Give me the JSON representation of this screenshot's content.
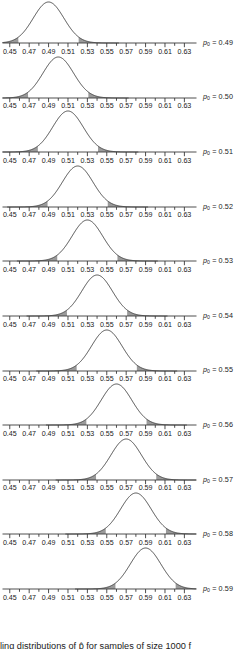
{
  "figure": {
    "caption": "ling distributions of p̂ for samples of size 1000 f",
    "panel_label_prefix": "p",
    "panel_label_subscript": "0",
    "panel_label_separator": " = "
  },
  "axis": {
    "tick_labels": [
      "0.45",
      "0.47",
      "0.49",
      "0.51",
      "0.53",
      "0.55",
      "0.57",
      "0.59",
      "0.61",
      "0.63"
    ],
    "tick_values": [
      0.45,
      0.47,
      0.49,
      0.51,
      0.53,
      0.55,
      0.57,
      0.59,
      0.61,
      0.63
    ],
    "minor_tick_values": [
      0.46,
      0.48,
      0.5,
      0.52,
      0.54,
      0.56,
      0.58,
      0.6,
      0.62
    ],
    "axis_min": 0.4425,
    "axis_max": 0.6425,
    "label_min": 0.45,
    "label_max": 0.63
  },
  "colors": {
    "curve": "#3a3a3a",
    "axis": "#3a3a3a",
    "tail_fill": "#9a9a9a",
    "text": "#1a1a1a",
    "background": "#ffffff"
  },
  "chart_data": {
    "type": "line",
    "title": "",
    "xlabel": "",
    "ylabel": "",
    "xlim": [
      0.4425,
      0.6425
    ],
    "grid": false,
    "legend": "right",
    "sample_size": 1000,
    "sigma": 0.0158,
    "tail_area_each_side": 0.025,
    "panels": [
      {
        "label": "p₀ = 0.49",
        "p0": 0.49,
        "mean": 0.49,
        "sd": 0.0158,
        "lower_cut": 0.459,
        "upper_cut": 0.521,
        "tick_labels": [
          "0.45",
          "0.47",
          "0.49",
          "0.51",
          "0.53",
          "0.55",
          "0.57",
          "0.59",
          "0.61",
          "0.63"
        ]
      },
      {
        "label": "p₀ = 0.50",
        "p0": 0.5,
        "mean": 0.5,
        "sd": 0.0158,
        "lower_cut": 0.469,
        "upper_cut": 0.531,
        "tick_labels": [
          "0.45",
          "0.47",
          "0.49",
          "0.51",
          "0.53",
          "0.55",
          "0.57",
          "0.59",
          "0.61",
          "0.63"
        ]
      },
      {
        "label": "p₀ = 0.51",
        "p0": 0.51,
        "mean": 0.51,
        "sd": 0.0158,
        "lower_cut": 0.479,
        "upper_cut": 0.541,
        "tick_labels": [
          "0.45",
          "0.47",
          "0.49",
          "0.51",
          "0.53",
          "0.55",
          "0.57",
          "0.59",
          "0.61",
          "0.63"
        ]
      },
      {
        "label": "p₀ = 0.52",
        "p0": 0.52,
        "mean": 0.52,
        "sd": 0.0158,
        "lower_cut": 0.489,
        "upper_cut": 0.551,
        "tick_labels": [
          "0.45",
          "0.47",
          "0.49",
          "0.51",
          "0.53",
          "0.55",
          "0.57",
          "0.59",
          "0.61",
          "0.63"
        ]
      },
      {
        "label": "p₀ = 0.53",
        "p0": 0.53,
        "mean": 0.53,
        "sd": 0.0158,
        "lower_cut": 0.499,
        "upper_cut": 0.561,
        "tick_labels": [
          "0.45",
          "0.47",
          "0.49",
          "0.51",
          "0.53",
          "0.55",
          "0.57",
          "0.59",
          "0.61",
          "0.63"
        ]
      },
      {
        "label": "p₀ = 0.54",
        "p0": 0.54,
        "mean": 0.54,
        "sd": 0.0158,
        "lower_cut": 0.509,
        "upper_cut": 0.571,
        "tick_labels": [
          "0.45",
          "0.47",
          "0.49",
          "0.51",
          "0.53",
          "0.55",
          "0.57",
          "0.59",
          "0.61",
          "0.63"
        ]
      },
      {
        "label": "p₀ = 0.55",
        "p0": 0.55,
        "mean": 0.55,
        "sd": 0.0158,
        "lower_cut": 0.519,
        "upper_cut": 0.581,
        "tick_labels": [
          "0.45",
          "0.47",
          "0.49",
          "0.51",
          "0.53",
          "0.55",
          "0.57",
          "0.59",
          "0.61",
          "0.63"
        ]
      },
      {
        "label": "p₀ = 0.56",
        "p0": 0.56,
        "mean": 0.56,
        "sd": 0.0158,
        "lower_cut": 0.529,
        "upper_cut": 0.591,
        "tick_labels": [
          "0.45",
          "0.47",
          "0.49",
          "0.51",
          "0.53",
          "0.55",
          "0.57",
          "0.59",
          "0.61",
          "0.63"
        ]
      },
      {
        "label": "p₀ = 0.57",
        "p0": 0.57,
        "mean": 0.57,
        "sd": 0.0158,
        "lower_cut": 0.539,
        "upper_cut": 0.601,
        "tick_labels": [
          "0.45",
          "0.47",
          "0.49",
          "0.51",
          "0.53",
          "0.55",
          "0.57",
          "0.59",
          "0.61",
          "0.63"
        ]
      },
      {
        "label": "p₀ = 0.58",
        "p0": 0.58,
        "mean": 0.58,
        "sd": 0.0158,
        "lower_cut": 0.549,
        "upper_cut": 0.611,
        "tick_labels": [
          "0.45",
          "0.47",
          "0.49",
          "0.51",
          "0.53",
          "0.55",
          "0.57",
          "0.59",
          "0.61",
          "0.63"
        ]
      },
      {
        "label": "p₀ = 0.59",
        "p0": 0.59,
        "mean": 0.59,
        "sd": 0.0158,
        "lower_cut": 0.559,
        "upper_cut": 0.621,
        "tick_labels": [
          "0.45",
          "0.47",
          "0.49",
          "0.51",
          "0.53",
          "0.55",
          "0.57",
          "0.59",
          "0.61",
          "0.63"
        ]
      }
    ]
  }
}
